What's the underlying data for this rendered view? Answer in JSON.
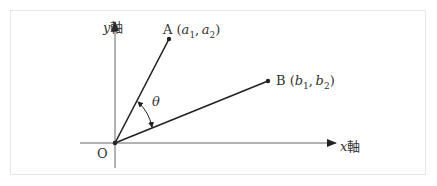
{
  "diagram": {
    "y_axis_label": {
      "var": "y",
      "suffix": "軸"
    },
    "x_axis_label": {
      "var": "x",
      "suffix": "軸"
    },
    "origin_label": "O",
    "angle_label": "θ",
    "point_a": {
      "name": "A",
      "coords": [
        "a",
        "1",
        "a",
        "2"
      ]
    },
    "point_b": {
      "name": "B",
      "coords": [
        "b",
        "1",
        "b",
        "2"
      ]
    },
    "colors": {
      "line": "#222222",
      "axis": "#666666",
      "frame": "#e6e6e6"
    }
  }
}
